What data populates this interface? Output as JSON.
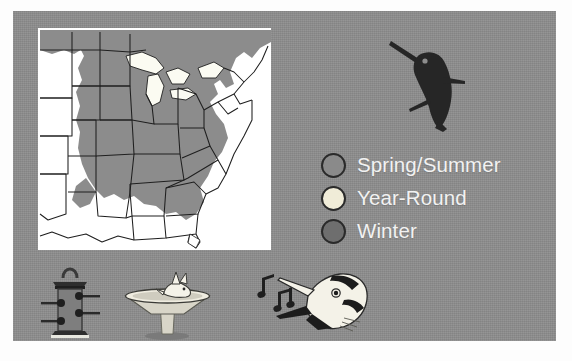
{
  "figure": {
    "panel_color": "#8d8d8d",
    "map_background": "#ffffff"
  },
  "map": {
    "name": "eastern-united-states-range-map",
    "region_description": "Eastern and central United States with state outlines and Great Lakes",
    "shading_color": "#8c8c8c",
    "unshaded_color": "#ffffff",
    "outline_color": "#1f1f1f"
  },
  "bird_illustration": {
    "name": "hummingbird-silhouette",
    "color": "#262626"
  },
  "legend": {
    "items": [
      {
        "label": "Spring/Summer",
        "color": "#8a8a8a",
        "outline": "#2a2a2a"
      },
      {
        "label": "Year-Round",
        "color": "#f0ecd8",
        "outline": "#2a2a2a"
      },
      {
        "label": "Winter",
        "color": "#6e6e6e",
        "outline": "#2a2a2a"
      }
    ],
    "text_color": "#f2f2f2"
  },
  "icons": [
    {
      "name": "bird-feeder-icon",
      "label": "Bird feeder"
    },
    {
      "name": "bird-bath-icon",
      "label": "Bird bath"
    },
    {
      "name": "singing-bird-icon",
      "label": "Singing bird with music notes"
    }
  ]
}
